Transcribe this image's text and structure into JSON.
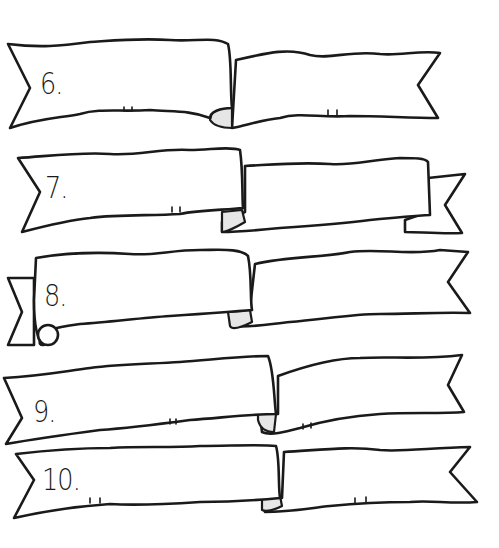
{
  "worksheet": {
    "banners": [
      {
        "label": "6."
      },
      {
        "label": "7."
      },
      {
        "label": "8."
      },
      {
        "label": "9."
      },
      {
        "label": "10."
      }
    ]
  },
  "colors": {
    "ink": "#1a1a1a",
    "paper": "#ffffff",
    "fold_shade": "#e6e6e6"
  }
}
